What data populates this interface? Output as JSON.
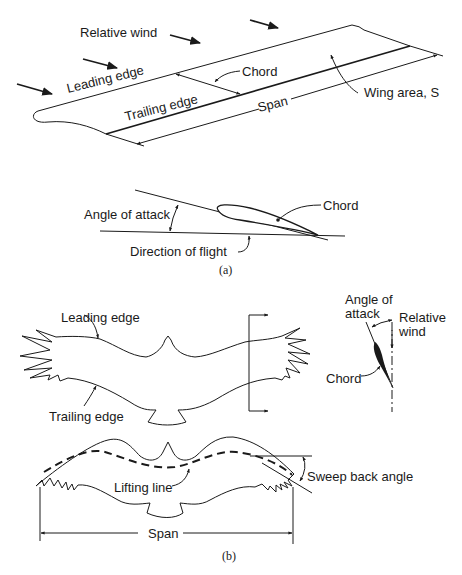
{
  "figure_a": {
    "wing": {
      "relative_wind": "Relative wind",
      "leading_edge": "Leading edge",
      "trailing_edge": "Trailing edge",
      "chord": "Chord",
      "span": "Span",
      "wing_area": "Wing area, S"
    },
    "airfoil": {
      "angle_of_attack": "Angle of attack",
      "chord": "Chord",
      "direction_of_flight": "Direction of flight"
    },
    "caption": "(a)"
  },
  "figure_b": {
    "bird_top": {
      "leading_edge": "Leading edge",
      "trailing_edge": "Trailing edge"
    },
    "section": {
      "angle_of_attack_line1": "Angle of",
      "angle_of_attack_line2": "attack",
      "relative_wind_line1": "Relative",
      "relative_wind_line2": "wind",
      "chord": "Chord"
    },
    "bird_bottom": {
      "lifting_line": "Lifting line",
      "sweep_back_angle": "Sweep back angle",
      "span": "Span"
    },
    "caption": "(b)"
  }
}
